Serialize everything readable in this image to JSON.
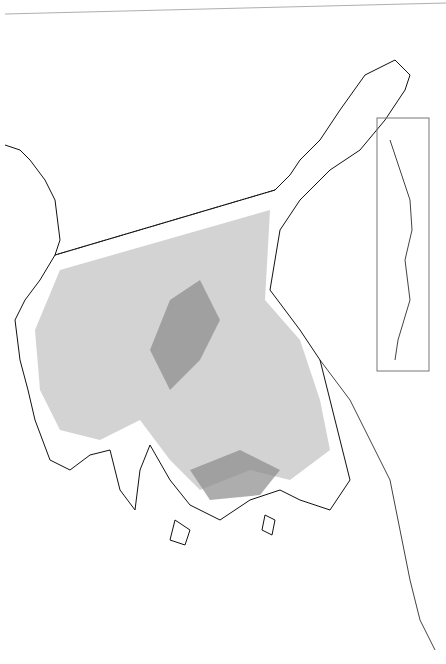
{
  "map": {
    "colors": {
      "background": "#ffffff",
      "outline": "#111111",
      "light_fill": "#c8c8c8",
      "dark_fill": "#8a8a8a",
      "frame": "#777777"
    },
    "inset": {
      "present": true
    }
  }
}
